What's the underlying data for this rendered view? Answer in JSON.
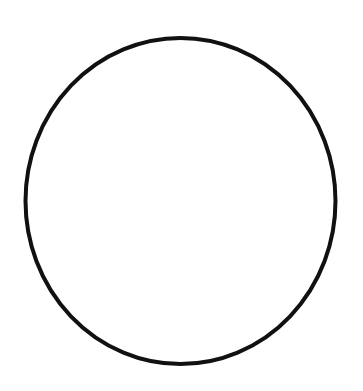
{
  "canvas": {
    "width": 363,
    "height": 391,
    "background": "#ffffff"
  },
  "shape": {
    "type": "circle-outline",
    "cx": 180.5,
    "cy": 201,
    "rx": 155,
    "ry": 163,
    "stroke": "#111111",
    "stroke_width": 4,
    "fill": "#ffffff"
  }
}
